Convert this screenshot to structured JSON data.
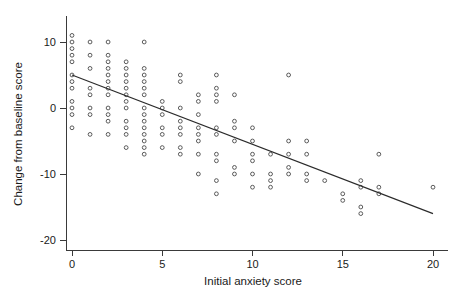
{
  "chart_data": {
    "type": "scatter",
    "title": "",
    "xlabel": "Initial anxiety score",
    "ylabel": "Change from baseline score",
    "xlim": [
      -0.4,
      20.6
    ],
    "ylim": [
      -21.5,
      11.8
    ],
    "xticks": [
      0,
      5,
      10,
      15,
      20
    ],
    "xtick_labels": [
      "0",
      "5",
      "10",
      "15",
      "20"
    ],
    "yticks": [
      10,
      0,
      -10,
      -20
    ],
    "ytick_labels": [
      "10",
      "0",
      "-10",
      "-20"
    ],
    "grid": false,
    "legend": null,
    "marker": "open-circle",
    "marker_size": 4,
    "series": [
      {
        "name": "observations",
        "points": [
          [
            0,
            11
          ],
          [
            0,
            10
          ],
          [
            0,
            9
          ],
          [
            0,
            8
          ],
          [
            0,
            7
          ],
          [
            0,
            5
          ],
          [
            0,
            4
          ],
          [
            0,
            3
          ],
          [
            0,
            1
          ],
          [
            0,
            0
          ],
          [
            0,
            -1
          ],
          [
            0,
            -3
          ],
          [
            1,
            10
          ],
          [
            1,
            8
          ],
          [
            1,
            6
          ],
          [
            1,
            3
          ],
          [
            1,
            2
          ],
          [
            1,
            0
          ],
          [
            1,
            -1
          ],
          [
            1,
            -4
          ],
          [
            2,
            10
          ],
          [
            2,
            8
          ],
          [
            2,
            7
          ],
          [
            2,
            6
          ],
          [
            2,
            5
          ],
          [
            2,
            4
          ],
          [
            2,
            3
          ],
          [
            2,
            2
          ],
          [
            2,
            0
          ],
          [
            2,
            -1
          ],
          [
            2,
            -2
          ],
          [
            2,
            -4
          ],
          [
            3,
            7
          ],
          [
            3,
            6
          ],
          [
            3,
            5
          ],
          [
            3,
            4
          ],
          [
            3,
            3
          ],
          [
            3,
            2
          ],
          [
            3,
            1
          ],
          [
            3,
            0
          ],
          [
            3,
            -2
          ],
          [
            3,
            -3
          ],
          [
            3,
            -4
          ],
          [
            3,
            -6
          ],
          [
            4,
            10
          ],
          [
            4,
            6
          ],
          [
            4,
            5
          ],
          [
            4,
            4
          ],
          [
            4,
            3
          ],
          [
            4,
            2
          ],
          [
            4,
            0
          ],
          [
            4,
            -1
          ],
          [
            4,
            -2
          ],
          [
            4,
            -3
          ],
          [
            4,
            -4
          ],
          [
            4,
            -5
          ],
          [
            4,
            -6
          ],
          [
            4,
            -7
          ],
          [
            5,
            1
          ],
          [
            5,
            0
          ],
          [
            5,
            -1
          ],
          [
            5,
            -3
          ],
          [
            5,
            -4
          ],
          [
            5,
            -6
          ],
          [
            6,
            5
          ],
          [
            6,
            4
          ],
          [
            6,
            0
          ],
          [
            6,
            -2
          ],
          [
            6,
            -3
          ],
          [
            6,
            -4
          ],
          [
            6,
            -6
          ],
          [
            6,
            -7
          ],
          [
            7,
            2
          ],
          [
            7,
            1
          ],
          [
            7,
            -1
          ],
          [
            7,
            -3
          ],
          [
            7,
            -4
          ],
          [
            7,
            -5
          ],
          [
            7,
            -7
          ],
          [
            7,
            -10
          ],
          [
            8,
            5
          ],
          [
            8,
            3
          ],
          [
            8,
            2
          ],
          [
            8,
            1
          ],
          [
            8,
            -3
          ],
          [
            8,
            -4
          ],
          [
            8,
            -7
          ],
          [
            8,
            -8
          ],
          [
            8,
            -11
          ],
          [
            8,
            -13
          ],
          [
            9,
            2
          ],
          [
            9,
            -2
          ],
          [
            9,
            -3
          ],
          [
            9,
            -5
          ],
          [
            9,
            -9
          ],
          [
            9,
            -10
          ],
          [
            10,
            -3
          ],
          [
            10,
            -5
          ],
          [
            10,
            -7
          ],
          [
            10,
            -8
          ],
          [
            10,
            -10
          ],
          [
            10,
            -12
          ],
          [
            11,
            -7
          ],
          [
            11,
            -10
          ],
          [
            11,
            -11
          ],
          [
            11,
            -12
          ],
          [
            12,
            5
          ],
          [
            12,
            -5
          ],
          [
            12,
            -7
          ],
          [
            12,
            -9
          ],
          [
            12,
            -10
          ],
          [
            13,
            -5
          ],
          [
            13,
            -7
          ],
          [
            13,
            -10
          ],
          [
            13,
            -11
          ],
          [
            14,
            -11
          ],
          [
            15,
            -13
          ],
          [
            15,
            -14
          ],
          [
            16,
            -11
          ],
          [
            16,
            -12
          ],
          [
            16,
            -15
          ],
          [
            16,
            -16
          ],
          [
            17,
            -7
          ],
          [
            17,
            -12
          ],
          [
            17,
            -13
          ],
          [
            20,
            -12
          ]
        ]
      }
    ],
    "fit_line": {
      "name": "linear regression",
      "x0": 0,
      "y0": 5.0,
      "x1": 20,
      "y1": -16.0
    }
  }
}
